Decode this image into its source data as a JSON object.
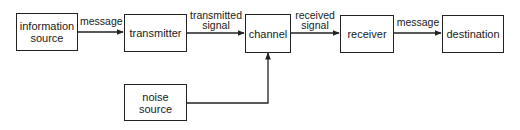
{
  "diagram": {
    "type": "shannon-communication-model",
    "nodes": [
      {
        "id": "information-source",
        "label": "information\nsource",
        "line1": "information",
        "line2": "source"
      },
      {
        "id": "transmitter",
        "label": "transmitter"
      },
      {
        "id": "channel",
        "label": "channel"
      },
      {
        "id": "receiver",
        "label": "receiver"
      },
      {
        "id": "destination",
        "label": "destination"
      },
      {
        "id": "noise-source",
        "label": "noise\nsource",
        "line1": "noise",
        "line2": "source"
      }
    ],
    "edges": [
      {
        "from": "information-source",
        "to": "transmitter",
        "label": "message"
      },
      {
        "from": "transmitter",
        "to": "channel",
        "label": "transmitted signal",
        "line1": "transmitted",
        "line2": "signal"
      },
      {
        "from": "channel",
        "to": "receiver",
        "label": "received signal",
        "line1": "received",
        "line2": "signal"
      },
      {
        "from": "receiver",
        "to": "destination",
        "label": "message"
      },
      {
        "from": "noise-source",
        "to": "channel",
        "label": ""
      }
    ]
  }
}
